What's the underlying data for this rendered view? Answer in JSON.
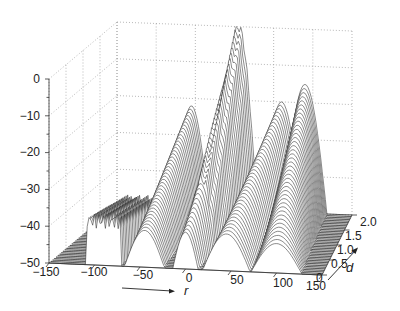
{
  "chart_data": {
    "type": "waterfall-3d",
    "title": "",
    "xlabel": "r",
    "ylabel": "d",
    "zlabel": "",
    "x_axis": {
      "label": "r",
      "range": [
        -150,
        150
      ],
      "ticks": [
        -150,
        -100,
        -50,
        0,
        50,
        100,
        150
      ],
      "tick_labels": [
        "−150",
        "−100",
        "−50",
        "0",
        "50",
        "100",
        "150"
      ]
    },
    "y_axis": {
      "label": "d",
      "range": [
        0,
        2.0
      ],
      "ticks": [
        0,
        0.5,
        1.0,
        1.5,
        2.0
      ],
      "tick_labels": [
        "0",
        "0.5",
        "1.0",
        "1.5",
        "2.0"
      ]
    },
    "z_axis": {
      "range": [
        -50,
        0
      ],
      "ticks": [
        0,
        -10,
        -20,
        -30,
        -40,
        -50
      ],
      "tick_labels": [
        "0",
        "−10",
        "−20",
        "−30",
        "−40",
        "−50"
      ]
    },
    "grid": true,
    "num_traces": 40,
    "features": [
      {
        "name": "main-lobe",
        "r_center": 0,
        "peak_db_at_d0": -40,
        "peak_db_at_d2": 0
      },
      {
        "name": "lobe-left",
        "r_center": -45,
        "peak_db_at_d0": -40,
        "peak_db_at_d2": -22
      },
      {
        "name": "lobe-right",
        "r_center": 45,
        "peak_db_at_d0": -40,
        "peak_db_at_d2": -20
      },
      {
        "name": "lobe-far-right",
        "r_center": 100,
        "peak_db_at_d0": -42,
        "peak_db_at_d2": -15
      },
      {
        "name": "sidelobes-left",
        "r_range": [
          -110,
          -70
        ],
        "level_db": -38
      }
    ]
  },
  "labels": {
    "r_axis": "r",
    "d_axis": "d"
  }
}
